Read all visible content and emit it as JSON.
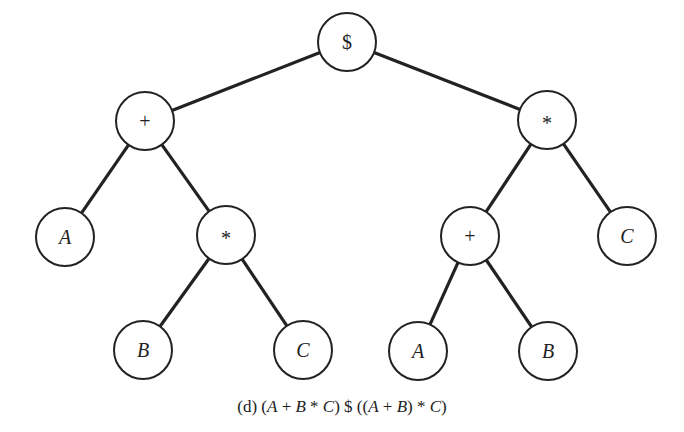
{
  "diagram": {
    "type": "expression-tree",
    "node_radius": 29,
    "stroke_color": "#222222",
    "nodes": [
      {
        "id": "root",
        "label": "$",
        "italic": false,
        "x": 347,
        "y": 42
      },
      {
        "id": "plus-left",
        "label": "+",
        "italic": false,
        "x": 145,
        "y": 121
      },
      {
        "id": "times-right",
        "label": "*",
        "italic": false,
        "x": 547,
        "y": 120
      },
      {
        "id": "a-left",
        "label": "A",
        "italic": true,
        "x": 65,
        "y": 237
      },
      {
        "id": "times-left",
        "label": "*",
        "italic": false,
        "x": 226,
        "y": 235
      },
      {
        "id": "plus-right",
        "label": "+",
        "italic": false,
        "x": 470,
        "y": 236
      },
      {
        "id": "c-right",
        "label": "C",
        "italic": true,
        "x": 627,
        "y": 236
      },
      {
        "id": "b-left",
        "label": "B",
        "italic": true,
        "x": 143,
        "y": 350
      },
      {
        "id": "c-left",
        "label": "C",
        "italic": true,
        "x": 303,
        "y": 350
      },
      {
        "id": "a-right",
        "label": "A",
        "italic": true,
        "x": 418,
        "y": 351
      },
      {
        "id": "b-right",
        "label": "B",
        "italic": true,
        "x": 548,
        "y": 351
      }
    ],
    "edges": [
      [
        "root",
        "plus-left"
      ],
      [
        "root",
        "times-right"
      ],
      [
        "plus-left",
        "a-left"
      ],
      [
        "plus-left",
        "times-left"
      ],
      [
        "times-left",
        "b-left"
      ],
      [
        "times-left",
        "c-left"
      ],
      [
        "times-right",
        "plus-right"
      ],
      [
        "times-right",
        "c-right"
      ],
      [
        "plus-right",
        "a-right"
      ],
      [
        "plus-right",
        "b-right"
      ]
    ]
  },
  "caption": {
    "prefix": "(d) (",
    "parts": [
      "(d) (",
      "A",
      " + ",
      "B",
      " * ",
      "C",
      ") $ ((",
      "A",
      " + ",
      "B",
      ") * ",
      "C",
      ")"
    ],
    "full_text": "(d) (A + B * C) $ ((A + B) * C)"
  }
}
